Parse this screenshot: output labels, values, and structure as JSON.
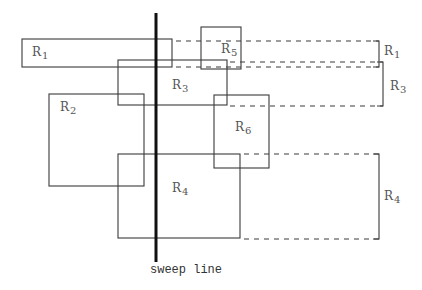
{
  "diagram": {
    "rectangles": [
      {
        "id": "R1",
        "base": "R",
        "sub": "1",
        "x1": 22,
        "y1": 39,
        "x2": 172,
        "y2": 67,
        "label_x": 32,
        "label_y": 48
      },
      {
        "id": "R2",
        "base": "R",
        "sub": "2",
        "x1": 49,
        "y1": 94,
        "x2": 144,
        "y2": 186,
        "label_x": 60,
        "label_y": 100
      },
      {
        "id": "R3",
        "base": "R",
        "sub": "3",
        "x1": 118,
        "y1": 60,
        "x2": 227,
        "y2": 105,
        "label_x": 172,
        "label_y": 78
      },
      {
        "id": "R4",
        "base": "R",
        "sub": "4",
        "x1": 118,
        "y1": 154,
        "x2": 240,
        "y2": 238,
        "label_x": 172,
        "label_y": 182
      },
      {
        "id": "R5",
        "base": "R",
        "sub": "5",
        "x1": 201,
        "y1": 27,
        "x2": 241,
        "y2": 69,
        "label_x": 221,
        "label_y": 42
      },
      {
        "id": "R6",
        "base": "R",
        "sub": "6",
        "x1": 214,
        "y1": 95,
        "x2": 269,
        "y2": 168,
        "label_x": 235,
        "label_y": 120
      }
    ],
    "sweep_line": {
      "x": 156,
      "y1": 13,
      "y2": 262,
      "label": "sweep line",
      "label_x": 150,
      "label_y": 263
    },
    "projections": [
      {
        "for": "R1",
        "top_y": 41,
        "bottom_y": 67,
        "dash_top_from": 173,
        "dash_bottom_from": 173,
        "bracket_x": 379,
        "label_x": 384,
        "label_y": 45
      },
      {
        "for": "R3",
        "top_y": 62,
        "bottom_y": 106,
        "dash_top_from": 228,
        "dash_bottom_from": 228,
        "bracket_x": 383,
        "label_x": 390,
        "label_y": 80
      },
      {
        "for": "R4",
        "top_y": 154,
        "bottom_y": 239,
        "dash_top_from": 241,
        "dash_bottom_from": 241,
        "bracket_x": 379,
        "label_x": 384,
        "label_y": 190
      }
    ],
    "labels": {
      "R1_right": {
        "base": "R",
        "sub": "1"
      },
      "R3_right": {
        "base": "R",
        "sub": "3"
      },
      "R4_right": {
        "base": "R",
        "sub": "4"
      }
    },
    "colors": {
      "stroke": "#3a3a3a",
      "sweep": "#111111",
      "text": "#555555"
    }
  }
}
